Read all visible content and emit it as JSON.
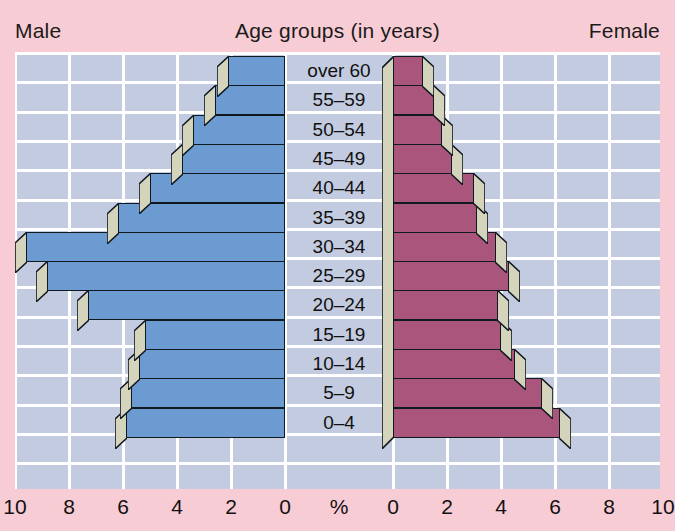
{
  "header": {
    "left_label": "Male",
    "title": "Age groups (in years)",
    "right_label": "Female"
  },
  "axis": {
    "unit_label": "%",
    "ticks_left": [
      "10",
      "8",
      "6",
      "4",
      "2",
      "0"
    ],
    "ticks_right": [
      "0",
      "2",
      "4",
      "6",
      "8",
      "10"
    ]
  },
  "colors": {
    "background": "#f8ccd4",
    "plot_background": "#c3cbe0",
    "grid": "#ffffff",
    "male_bar": "#6b9bd1",
    "female_bar": "#a9557c",
    "bar_side": "#d4d3bb",
    "bar_outline": "#101820",
    "text": "#111111"
  },
  "chart_data": {
    "type": "bar",
    "title": "Age groups (in years)",
    "xlabel": "%",
    "ylabel": "",
    "xlim": [
      -10,
      10
    ],
    "grid": true,
    "legend_position": "top",
    "categories": [
      "over 60",
      "55–59",
      "50–54",
      "45–49",
      "40–44",
      "35–39",
      "30–34",
      "25–29",
      "20–24",
      "15–19",
      "10–14",
      "5–9",
      "0–4"
    ],
    "series": [
      {
        "name": "Male",
        "side": "left",
        "color": "#6b9bd1",
        "values": [
          2.1,
          2.6,
          3.4,
          3.8,
          5.0,
          6.2,
          9.6,
          8.8,
          7.3,
          5.2,
          5.4,
          5.7,
          5.9
        ]
      },
      {
        "name": "Female",
        "side": "right",
        "color": "#a9557c",
        "values": [
          1.1,
          1.5,
          1.8,
          2.2,
          3.0,
          3.1,
          3.8,
          4.3,
          3.9,
          4.0,
          4.5,
          5.5,
          6.2
        ]
      }
    ]
  },
  "grid_lines": {
    "vertical_values": [
      -10,
      -8,
      -6,
      -4,
      -2,
      0,
      2,
      4,
      6,
      8,
      10
    ],
    "horizontal_rows": 14
  }
}
